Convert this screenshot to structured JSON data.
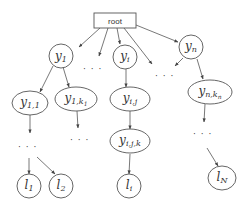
{
  "diagram": {
    "type": "tree",
    "root": {
      "label": "root"
    },
    "nodes": {
      "y1": {
        "base": "y",
        "sub": "1"
      },
      "yi": {
        "base": "y",
        "sub": "i"
      },
      "yn": {
        "base": "y",
        "sub": "n"
      },
      "y11": {
        "base": "y",
        "sub": "1,1"
      },
      "y1k1": {
        "base": "y",
        "sub": "1,k",
        "subsub": "1"
      },
      "yij": {
        "base": "y",
        "sub": "i,j"
      },
      "yijk": {
        "base": "y",
        "sub": "i,j,k"
      },
      "ynkn": {
        "base": "y",
        "sub": "n,k",
        "subsub": "n"
      },
      "l1": {
        "base": "l",
        "sub": "1"
      },
      "l2": {
        "base": "l",
        "sub": "2"
      },
      "li": {
        "base": "l",
        "sub": "i"
      },
      "lN": {
        "base": "l",
        "sub": "N"
      }
    },
    "ellipsis": "· · ·",
    "edges": [
      [
        "root",
        "y1"
      ],
      [
        "root",
        "dots-a"
      ],
      [
        "root",
        "yi"
      ],
      [
        "root",
        "dots-b"
      ],
      [
        "root",
        "yn"
      ],
      [
        "y1",
        "y11"
      ],
      [
        "y1",
        "y1k1"
      ],
      [
        "yn",
        "dots-b"
      ],
      [
        "yn",
        "ynkn"
      ],
      [
        "yi",
        "yij"
      ],
      [
        "yij",
        "yijk"
      ],
      [
        "yijk",
        "li"
      ],
      [
        "y11",
        "dots-c"
      ],
      [
        "y1k1",
        "dots-d"
      ],
      [
        "ynkn",
        "dots-e"
      ],
      [
        "dots-c",
        "l1"
      ],
      [
        "dots-c",
        "l2"
      ],
      [
        "dots-e",
        "lN"
      ]
    ]
  }
}
